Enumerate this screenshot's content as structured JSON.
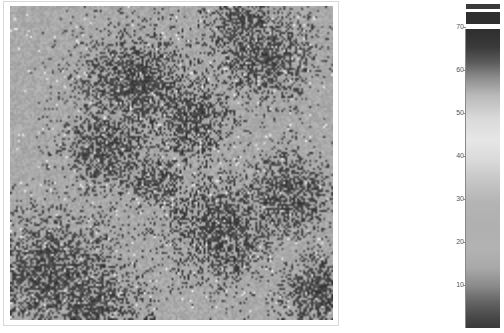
{
  "image": {
    "description": "Grayscale spatial intensity map with clustered dark patches on a mid-gray background, with a vertical colorbar legend",
    "map": {
      "palette": {
        "background": "#a9a9a9",
        "dark": "#2e2e2e",
        "light": "#e4e4e4"
      }
    },
    "colorbar": {
      "top_swatches": [
        {
          "color": "#3a3a3a"
        },
        {
          "color": "#2f2f2f"
        }
      ],
      "ticks": [
        {
          "label": "70",
          "y": 27
        },
        {
          "label": "60",
          "y": 70
        },
        {
          "label": "50",
          "y": 113
        },
        {
          "label": "40",
          "y": 156
        },
        {
          "label": "30",
          "y": 199
        },
        {
          "label": "20",
          "y": 242
        },
        {
          "label": "10",
          "y": 285
        }
      ]
    }
  }
}
